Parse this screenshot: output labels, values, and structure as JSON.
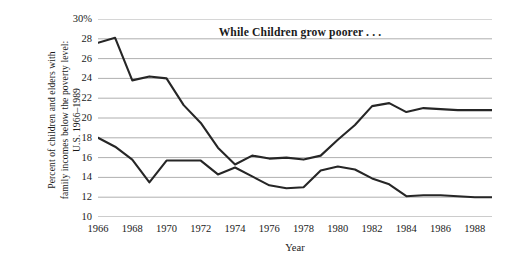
{
  "chart_data": {
    "type": "line",
    "title": "While Children grow poorer . . .",
    "xlabel": "Year",
    "ylabel": "Percent of children and elders with\nfamily incomes below the poverty level:\nU.S. 1966–1989",
    "xlim": [
      1966,
      1989
    ],
    "ylim": [
      10,
      30
    ],
    "yticks": [
      "30%",
      "28",
      "26",
      "24",
      "22",
      "20",
      "18",
      "16",
      "14",
      "12",
      "10"
    ],
    "ytick_values": [
      30,
      28,
      26,
      24,
      22,
      20,
      18,
      16,
      14,
      12,
      10
    ],
    "xticks": [
      "1966",
      "1968",
      "1970",
      "1972",
      "1974",
      "1976",
      "1978",
      "1980",
      "1982",
      "1984",
      "1986",
      "1988"
    ],
    "xtick_values": [
      1966,
      1968,
      1970,
      1972,
      1974,
      1976,
      1978,
      1980,
      1982,
      1984,
      1986,
      1988
    ],
    "x": [
      1966,
      1967,
      1968,
      1969,
      1970,
      1971,
      1972,
      1973,
      1974,
      1975,
      1976,
      1977,
      1978,
      1979,
      1980,
      1981,
      1982,
      1983,
      1984,
      1985,
      1986,
      1987,
      1988,
      1989
    ],
    "grid": true,
    "legend": "none",
    "line_color": "#262626",
    "grid_color": "#9a9a9a",
    "series": [
      {
        "name": "Children",
        "values": [
          27.6,
          28.1,
          23.8,
          24.2,
          24.0,
          21.3,
          19.5,
          17.0,
          15.3,
          16.2,
          15.9,
          16.0,
          15.8,
          16.2,
          17.8,
          19.3,
          21.2,
          21.5,
          20.6,
          21.0,
          20.9,
          20.8,
          20.8,
          20.8
        ]
      },
      {
        "name": "Elders",
        "values": [
          18.0,
          17.1,
          15.8,
          13.5,
          15.7,
          15.7,
          15.7,
          14.3,
          15.0,
          14.1,
          13.2,
          12.9,
          13.0,
          14.7,
          15.1,
          14.8,
          13.9,
          13.3,
          12.1,
          12.2,
          12.2,
          12.1,
          12.0,
          12.0
        ]
      }
    ]
  }
}
